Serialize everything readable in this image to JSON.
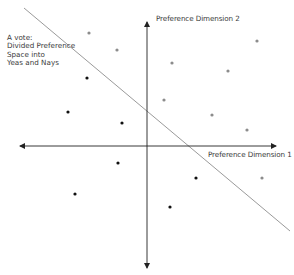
{
  "diagram": {
    "vote_label": [
      "A vote:",
      "Divided Preference",
      "Space into",
      "Yeas and Nays"
    ],
    "axis_x_label": "Preference Dimension 1",
    "axis_y_label": "Preference Dimension 2",
    "colors": {
      "axis": "#222222",
      "cutting_line": "#9a9a9a",
      "yea_point": "#8c8c8c",
      "nay_point": "#111111"
    },
    "axes": {
      "x_axis": {
        "x1": 20,
        "x2": 276,
        "y": 146
      },
      "y_axis": {
        "x": 147,
        "y1": 22,
        "y2": 268
      }
    },
    "cutting_line": {
      "x1": 24,
      "y1": 8,
      "x2": 290,
      "y2": 231
    },
    "gray_points": [
      {
        "x": 89,
        "y": 33
      },
      {
        "x": 117,
        "y": 50
      },
      {
        "x": 257,
        "y": 41
      },
      {
        "x": 172,
        "y": 63
      },
      {
        "x": 228,
        "y": 71
      },
      {
        "x": 164,
        "y": 100
      },
      {
        "x": 212,
        "y": 115
      },
      {
        "x": 247,
        "y": 130
      },
      {
        "x": 262,
        "y": 178
      }
    ],
    "black_points": [
      {
        "x": 87,
        "y": 78
      },
      {
        "x": 68,
        "y": 112
      },
      {
        "x": 122,
        "y": 123
      },
      {
        "x": 118,
        "y": 163
      },
      {
        "x": 196,
        "y": 178
      },
      {
        "x": 75,
        "y": 194
      },
      {
        "x": 170,
        "y": 207
      }
    ]
  }
}
